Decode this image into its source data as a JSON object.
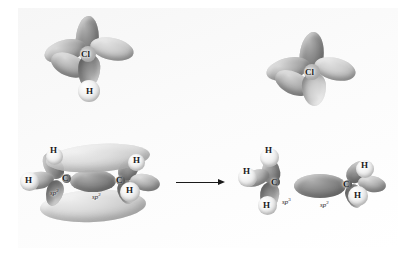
{
  "figure": {
    "type": "reaction-scheme",
    "background_color": "#ffffff",
    "panel_color": "#f7f7f7",
    "arrow": {
      "label": "",
      "direction": "right",
      "name": "reaction-arrow"
    }
  },
  "reactants": {
    "hydrogen_chloride": {
      "name": "hydrogen-chloride",
      "atoms": [
        {
          "symbol": "Cl",
          "name": "chlorine-atom"
        },
        {
          "symbol": "H",
          "name": "hydrogen-atom"
        }
      ],
      "orbital_lobes": 4
    },
    "ethene": {
      "name": "ethene",
      "atoms": [
        {
          "symbol": "C",
          "name": "carbon-left"
        },
        {
          "symbol": "C",
          "name": "carbon-right"
        },
        {
          "symbol": "H",
          "name": "hydrogen-upper-left"
        },
        {
          "symbol": "H",
          "name": "hydrogen-lower-left"
        },
        {
          "symbol": "H",
          "name": "hydrogen-upper-right"
        },
        {
          "symbol": "H",
          "name": "hydrogen-lower-right"
        }
      ],
      "hybridization_labels": [
        {
          "base": "sp",
          "exponent": "2",
          "name": "hybridization-left"
        },
        {
          "base": "sp",
          "exponent": "2",
          "name": "hybridization-right"
        }
      ],
      "pi_cloud": "above-and-below-plane"
    }
  },
  "products": {
    "chloride_ion": {
      "name": "chloride-ion",
      "atoms": [
        {
          "symbol": "Cl",
          "name": "chlorine-atom"
        }
      ],
      "orbital_lobes": 4
    },
    "ethyl_cation": {
      "name": "ethyl-cation",
      "atoms": [
        {
          "symbol": "C",
          "name": "carbon-left"
        },
        {
          "symbol": "C",
          "name": "carbon-right"
        },
        {
          "symbol": "H",
          "name": "hydrogen-top-left"
        },
        {
          "symbol": "H",
          "name": "hydrogen-mid-left"
        },
        {
          "symbol": "H",
          "name": "hydrogen-bottom-left"
        },
        {
          "symbol": "H",
          "name": "hydrogen-upper-right"
        },
        {
          "symbol": "H",
          "name": "hydrogen-lower-right"
        }
      ],
      "hybridization_labels": [
        {
          "base": "sp",
          "exponent": "3",
          "name": "hybridization-left"
        },
        {
          "base": "sp",
          "exponent": "2",
          "name": "hybridization-right"
        }
      ],
      "empty_p_orbital": "on-right-carbon"
    }
  }
}
